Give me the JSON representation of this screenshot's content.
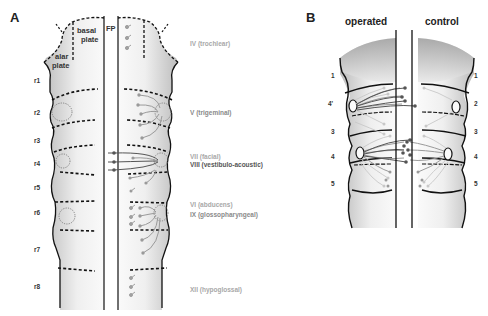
{
  "panel_a": {
    "letter": "A",
    "region_labels": {
      "basal_line1": "basal",
      "basal_line2": "plate",
      "alar_line1": "alar",
      "alar_line2": "plate",
      "floor_plate": "FP"
    },
    "rhombomeres": [
      "r1",
      "r2",
      "r3",
      "r4",
      "r5",
      "r6",
      "r7",
      "r8"
    ],
    "nerves": [
      {
        "label": "IV (trochlear)",
        "style": "gray"
      },
      {
        "label": "V (trigeminal)",
        "style": "dark"
      },
      {
        "label": "VII (facial)",
        "style": "gray"
      },
      {
        "label": "VIII (vestibulo-acoustic)",
        "style": "dark"
      },
      {
        "label": "VI (abducens)",
        "style": "gray"
      },
      {
        "label": "IX (glossopharyngeal)",
        "style": "dark"
      },
      {
        "label": "XII (hypoglossal)",
        "style": "gray"
      }
    ]
  },
  "panel_b": {
    "letter": "B",
    "columns": {
      "left": "operated",
      "right": "control"
    },
    "left_segments": [
      "1",
      "4'",
      "3",
      "4",
      "5"
    ],
    "right_segments": [
      "1",
      "2",
      "3",
      "4",
      "5"
    ]
  },
  "colors": {
    "tube_shade_dark": "#b9b9b9",
    "tube_shade_light": "#f7f7f7",
    "outline": "#111111",
    "neuron_gray": "#9a9a9a",
    "neuron_dark": "#555555",
    "nerve_label_gray": "#a8a8a8",
    "nerve_label_dark": "#555555"
  }
}
